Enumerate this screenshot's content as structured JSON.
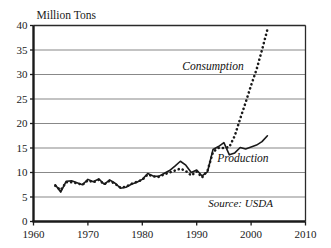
{
  "chart_data": {
    "type": "line",
    "title": "",
    "ylabel": "Million Tons",
    "xlabel": "",
    "xlim": [
      1960,
      2010
    ],
    "ylim": [
      0,
      40
    ],
    "yticks": [
      0,
      5,
      10,
      15,
      20,
      25,
      30,
      35,
      40
    ],
    "xticks": [
      1960,
      1970,
      1980,
      1990,
      2000,
      2010
    ],
    "grid": "horizontal",
    "legend_position": "inline-annotations",
    "annotations": [
      {
        "text": "Consumption",
        "x": 1993.0,
        "y": 31.0,
        "style": "italic"
      },
      {
        "text": "Production",
        "x": 1998.5,
        "y": 12.2,
        "style": "italic"
      },
      {
        "text": "Source: USDA",
        "x": 2004.0,
        "y": 3.0,
        "style": "italic"
      }
    ],
    "series": [
      {
        "name": "Production",
        "style": "solid",
        "color": "#1a1a1a",
        "x": [
          1964,
          1965,
          1966,
          1967,
          1968,
          1969,
          1970,
          1971,
          1972,
          1973,
          1974,
          1975,
          1976,
          1977,
          1978,
          1979,
          1980,
          1981,
          1982,
          1983,
          1984,
          1985,
          1986,
          1987,
          1988,
          1989,
          1990,
          1991,
          1992,
          1993,
          1994,
          1995,
          1996,
          1997,
          1998,
          1999,
          2000,
          2001,
          2002,
          2003
        ],
        "values": [
          7.5,
          6.0,
          8.2,
          8.3,
          7.9,
          7.5,
          8.6,
          8.1,
          8.7,
          7.6,
          8.5,
          7.8,
          6.8,
          7.0,
          7.6,
          8.0,
          8.6,
          9.8,
          9.3,
          9.2,
          9.8,
          10.4,
          11.3,
          12.3,
          11.5,
          10.0,
          10.5,
          9.3,
          10.2,
          14.7,
          15.3,
          16.1,
          13.6,
          14.0,
          15.1,
          14.8,
          15.2,
          15.6,
          16.3,
          17.5
        ]
      },
      {
        "name": "Consumption",
        "style": "dotted",
        "color": "#1a1a1a",
        "x": [
          1964,
          1965,
          1966,
          1967,
          1968,
          1969,
          1970,
          1971,
          1972,
          1973,
          1974,
          1975,
          1976,
          1977,
          1978,
          1979,
          1980,
          1981,
          1982,
          1983,
          1984,
          1985,
          1986,
          1987,
          1988,
          1989,
          1990,
          1991,
          1992,
          1993,
          1994,
          1995,
          1996,
          1997,
          1998,
          1999,
          2000,
          2001,
          2002,
          2003
        ],
        "values": [
          7.3,
          6.4,
          8.0,
          8.0,
          7.8,
          7.5,
          8.4,
          8.0,
          8.5,
          7.6,
          8.3,
          7.7,
          6.9,
          7.1,
          7.7,
          8.1,
          8.5,
          9.6,
          9.2,
          9.1,
          9.6,
          10.0,
          10.4,
          10.8,
          10.3,
          9.4,
          10.2,
          9.0,
          10.4,
          14.2,
          15.0,
          15.0,
          15.2,
          17.5,
          21.0,
          24.3,
          27.8,
          31.0,
          35.0,
          39.2
        ]
      }
    ]
  }
}
